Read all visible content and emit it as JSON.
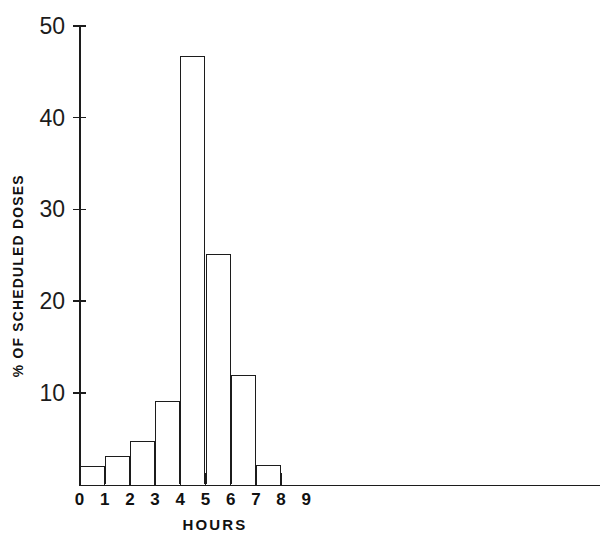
{
  "chart_data": {
    "type": "bar",
    "title": "",
    "subtitle": "",
    "xlabel": "HOURS",
    "ylabel": "% OF SCHEDULED DOSES",
    "categories": [
      "0-1",
      "1-2",
      "2-3",
      "3-4",
      "4-5",
      "5-6",
      "6-7",
      "7-8"
    ],
    "bin_edges": [
      0,
      1,
      2,
      3,
      4,
      5,
      6,
      7,
      8
    ],
    "values": [
      2.0,
      3.1,
      4.7,
      9.1,
      46.7,
      25.1,
      11.9,
      2.1
    ],
    "xlim": [
      0,
      9
    ],
    "ylim": [
      0,
      50
    ],
    "xticks": [
      0,
      1,
      2,
      3,
      4,
      5,
      6,
      7,
      8,
      9
    ],
    "xtick_labels": [
      "0",
      "1",
      "2",
      "3",
      "4",
      "5",
      "6",
      "7",
      "8",
      "9"
    ],
    "yticks": [
      10,
      20,
      30,
      40,
      50
    ],
    "ytick_labels": [
      "10",
      "20",
      "30",
      "40",
      "50"
    ],
    "grid": false,
    "legend": null,
    "legend_position": "none",
    "bar_style": {
      "fill": "#ffffff",
      "edge": "#1c1c1c"
    },
    "annotations": []
  },
  "figure": {
    "background": "#ffffff",
    "axis_color": "#1c1c1c",
    "text_color": "#111111"
  }
}
